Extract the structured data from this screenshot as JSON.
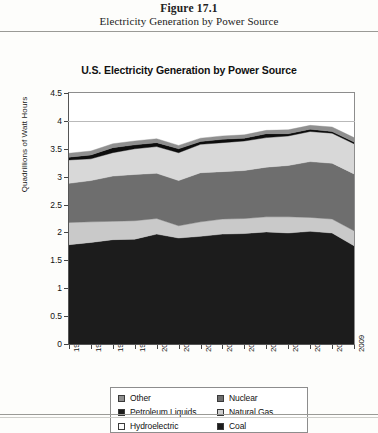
{
  "figure": {
    "number": "Figure 17.1",
    "caption": "Electricity Generation by Power Source"
  },
  "chart_data": {
    "type": "area",
    "stacked": true,
    "title": "U.S. Electricity Generation by Power Source",
    "xlabel": "",
    "ylabel": "Quadrillions of Watt Hours",
    "ylim": [
      0,
      4.5
    ],
    "yticks": [
      "0",
      "0.5",
      "1",
      "1.5",
      "2",
      "2.5",
      "3",
      "3.5",
      "4",
      "4.5"
    ],
    "ytick_values": [
      0,
      0.5,
      1,
      1.5,
      2,
      2.5,
      3,
      3.5,
      4,
      4.5
    ],
    "grid": "horizontal-at-4",
    "legend_position": "bottom",
    "categories": [
      "1996",
      "1997",
      "1998",
      "1999",
      "2000",
      "2001",
      "2002",
      "2003",
      "2004",
      "2005",
      "2006",
      "2007",
      "2008",
      "2009"
    ],
    "series": [
      {
        "name": "Coal",
        "color": "#1c1c1c",
        "values": [
          1.78,
          1.82,
          1.87,
          1.88,
          1.97,
          1.9,
          1.93,
          1.97,
          1.98,
          2.01,
          1.99,
          2.02,
          1.99,
          1.76
        ]
      },
      {
        "name": "Hydroelectric",
        "color": "#c9c9c9",
        "values": [
          0.4,
          0.37,
          0.33,
          0.33,
          0.28,
          0.22,
          0.26,
          0.27,
          0.27,
          0.27,
          0.29,
          0.25,
          0.25,
          0.27
        ]
      },
      {
        "name": "Natural Gas",
        "color": "#6e6e6e",
        "values": [
          0.7,
          0.74,
          0.81,
          0.83,
          0.81,
          0.81,
          0.88,
          0.85,
          0.86,
          0.89,
          0.92,
          1.0,
          1.0,
          1.02
        ]
      },
      {
        "name": "Nuclear",
        "color": "#d8d8d8",
        "values": [
          0.42,
          0.39,
          0.42,
          0.46,
          0.48,
          0.5,
          0.51,
          0.52,
          0.53,
          0.53,
          0.53,
          0.54,
          0.54,
          0.54
        ]
      },
      {
        "name": "Petroleum Liquids",
        "color": "#0d0d0d",
        "values": [
          0.05,
          0.07,
          0.09,
          0.07,
          0.07,
          0.07,
          0.05,
          0.06,
          0.05,
          0.07,
          0.04,
          0.04,
          0.03,
          0.03
        ]
      },
      {
        "name": "Other",
        "color": "#8f8f8f",
        "values": [
          0.07,
          0.07,
          0.07,
          0.07,
          0.07,
          0.06,
          0.06,
          0.06,
          0.06,
          0.06,
          0.07,
          0.07,
          0.08,
          0.08
        ]
      }
    ],
    "legend_entries": [
      {
        "label": "Other",
        "color": "#8f8f8f"
      },
      {
        "label": "Nuclear",
        "color": "#6e6e6e"
      },
      {
        "label": "Petroleum Liquids",
        "color": "#1c1c1c"
      },
      {
        "label": "Natural Gas",
        "color": "#cfcfcf"
      },
      {
        "label": "Hydroelectric",
        "color": "#fbfbfb"
      },
      {
        "label": "Coal",
        "color": "#1c1c1c"
      }
    ]
  }
}
